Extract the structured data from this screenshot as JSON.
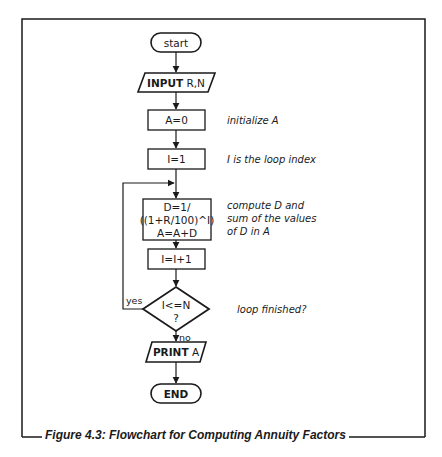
{
  "figure": {
    "caption": "Figure 4.3: Flowchart for Computing Annuity Factors"
  },
  "nodes": {
    "start": {
      "label": "start",
      "shape": "terminal"
    },
    "input": {
      "keyword": "INPUT",
      "args": " R,N",
      "shape": "parallelogram"
    },
    "init_a": {
      "label": "A=0",
      "shape": "process"
    },
    "init_i": {
      "label": "I=1",
      "shape": "process"
    },
    "compute": {
      "lines": [
        "D=1/",
        "((1+R/100)^I)",
        "A=A+D"
      ],
      "shape": "process"
    },
    "increment": {
      "label": "I=I+1",
      "shape": "process"
    },
    "decision": {
      "lines": [
        "I<=N",
        "?"
      ],
      "shape": "diamond"
    },
    "print": {
      "keyword": "PRINT",
      "args": " A",
      "shape": "parallelogram"
    },
    "end": {
      "label": "END",
      "shape": "terminal"
    }
  },
  "edge_labels": {
    "yes": "yes",
    "no": "no"
  },
  "annotations": {
    "init_a": "initialize A",
    "init_i": "I is the loop index",
    "compute": [
      "compute D and",
      "sum of the values",
      "of D in A"
    ],
    "decision": "loop finished?"
  },
  "colors": {
    "line": "#1a1a1a",
    "background": "#ffffff"
  }
}
